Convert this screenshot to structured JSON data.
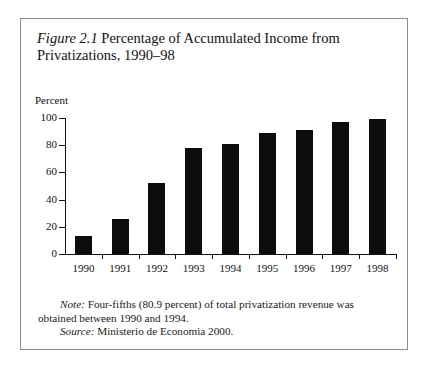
{
  "figure": {
    "number": "Figure 2.1",
    "title_rest": " Percentage of Accumulated Income from Privatizations, 1990–98",
    "note_lead": "Note:",
    "note_text": " Four-fifths (80.9 percent) of total privatization revenue was obtained between 1990 and 1994.",
    "source_lead": "Source:",
    "source_text": " Ministerio de Economia 2000."
  },
  "chart_data": {
    "type": "bar",
    "title": "Figure 2.1 Percentage of Accumulated Income from Privatizations, 1990–98",
    "categories": [
      "1990",
      "1991",
      "1992",
      "1993",
      "1994",
      "1995",
      "1996",
      "1997",
      "1998"
    ],
    "values": [
      13,
      26,
      52,
      78,
      81,
      89,
      91,
      97,
      99
    ],
    "xlabel": "",
    "ylabel": "Percent",
    "ylim": [
      0,
      100
    ],
    "yticks": [
      0,
      20,
      40,
      60,
      80,
      100
    ],
    "ytick_labels": [
      "0",
      "20",
      "40",
      "60",
      "80",
      "100"
    ],
    "grid": false,
    "legend": "none",
    "bar_color": "#0d0d0d",
    "axis_color": "#111111"
  }
}
